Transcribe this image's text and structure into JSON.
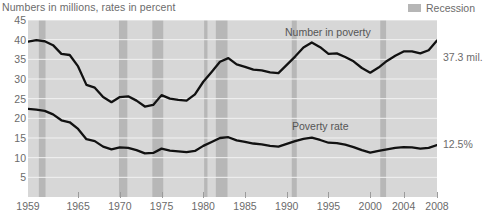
{
  "header": {
    "title": "Numbers in millions, rates in percent"
  },
  "legend": {
    "items": [
      {
        "label": "Recession",
        "color": "#b6b6b6",
        "swatch_name": "recession-swatch"
      }
    ]
  },
  "callouts": [
    {
      "name": "poverty-number-callout",
      "text": "37.3 mil.",
      "y": 52
    },
    {
      "name": "poverty-rate-callout",
      "text": "12.5%",
      "y": 139
    }
  ],
  "series_labels": [
    {
      "name": "number-in-poverty-label",
      "text": "Number in poverty",
      "x": 285,
      "y": 27
    },
    {
      "name": "poverty-rate-label",
      "text": "Poverty rate",
      "x": 292,
      "y": 121
    }
  ],
  "axes": {
    "y": {
      "ticks": [
        45,
        40,
        35,
        30,
        25,
        20,
        15,
        10,
        5
      ],
      "min": 0,
      "max": 45
    },
    "x": {
      "ticks": [
        "1959",
        "1965",
        "1970",
        "1975",
        "1980",
        "1985",
        "1990",
        "1995",
        "2000",
        "2004",
        "2008"
      ],
      "tick_years": [
        1959,
        1965,
        1970,
        1975,
        1980,
        1985,
        1990,
        1995,
        2000,
        2004,
        2008
      ],
      "min": 1959,
      "max": 2008
    }
  },
  "chart_data": {
    "type": "line",
    "title": "Numbers in millions, rates in percent",
    "xlabel": "",
    "ylabel": "",
    "xlim": [
      1959,
      2008
    ],
    "ylim": [
      0,
      45
    ],
    "grid": true,
    "legend_position": "top-right",
    "x": [
      1959,
      1960,
      1961,
      1962,
      1963,
      1964,
      1965,
      1966,
      1967,
      1968,
      1969,
      1970,
      1971,
      1972,
      1973,
      1974,
      1975,
      1976,
      1977,
      1978,
      1979,
      1980,
      1981,
      1982,
      1983,
      1984,
      1985,
      1986,
      1987,
      1988,
      1989,
      1990,
      1991,
      1992,
      1993,
      1994,
      1995,
      1996,
      1997,
      1998,
      1999,
      2000,
      2001,
      2002,
      2003,
      2004,
      2005,
      2006,
      2007,
      2008
    ],
    "series": [
      {
        "name": "Number in poverty",
        "unit": "millions",
        "end_label": "37.3 mil.",
        "values": [
          39.5,
          39.9,
          39.6,
          38.6,
          36.4,
          36.1,
          33.2,
          28.5,
          27.8,
          25.4,
          24.1,
          25.4,
          25.6,
          24.5,
          23.0,
          23.4,
          25.9,
          25.0,
          24.7,
          24.5,
          26.1,
          29.3,
          31.8,
          34.4,
          35.3,
          33.7,
          33.1,
          32.4,
          32.2,
          31.7,
          31.5,
          33.6,
          35.7,
          38.0,
          39.3,
          38.1,
          36.4,
          36.5,
          35.6,
          34.5,
          32.8,
          31.6,
          32.9,
          34.6,
          35.9,
          37.0,
          37.0,
          36.5,
          37.3,
          39.8
        ]
      },
      {
        "name": "Poverty rate",
        "unit": "percent",
        "end_label": "12.5%",
        "values": [
          22.4,
          22.2,
          21.9,
          21.0,
          19.5,
          19.0,
          17.3,
          14.7,
          14.2,
          12.8,
          12.1,
          12.6,
          12.5,
          11.9,
          11.1,
          11.2,
          12.3,
          11.8,
          11.6,
          11.4,
          11.7,
          13.0,
          14.0,
          15.0,
          15.2,
          14.4,
          14.0,
          13.6,
          13.4,
          13.0,
          12.8,
          13.5,
          14.2,
          14.8,
          15.1,
          14.5,
          13.8,
          13.7,
          13.3,
          12.7,
          11.9,
          11.3,
          11.7,
          12.1,
          12.5,
          12.7,
          12.6,
          12.3,
          12.5,
          13.2
        ]
      }
    ],
    "recessions": [
      {
        "start": 1960.3,
        "end": 1961.1
      },
      {
        "start": 1969.9,
        "end": 1970.9
      },
      {
        "start": 1973.9,
        "end": 1975.2
      },
      {
        "start": 1980.1,
        "end": 1980.5
      },
      {
        "start": 1981.5,
        "end": 1982.9
      },
      {
        "start": 1990.6,
        "end": 1991.2
      },
      {
        "start": 2001.2,
        "end": 2001.9
      }
    ]
  }
}
